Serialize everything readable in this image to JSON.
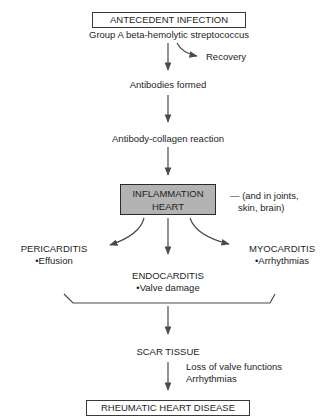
{
  "diagram": {
    "type": "flowchart",
    "nodes": {
      "antecedent": {
        "label": "ANTECEDENT INFECTION",
        "sub": "Group A beta-hemolytic streptococcus"
      },
      "recovery": {
        "label": "Recovery"
      },
      "antibodies": {
        "label": "Antibodies formed"
      },
      "reaction": {
        "label": "Antibody-collagen reaction"
      },
      "inflammation": {
        "line1": "INFLAMMATION",
        "line2": "HEART"
      },
      "inflammation_note": {
        "line1": "— (and in joints,",
        "line2": "skin, brain)"
      },
      "pericarditis": {
        "label": "PERICARDITIS",
        "bullet": "•Effusion"
      },
      "endocarditis": {
        "label": "ENDOCARDITIS",
        "bullet": "•Valve damage"
      },
      "myocarditis": {
        "label": "MYOCARDITIS",
        "bullet": "•Arrhythmias"
      },
      "scar": {
        "label": "SCAR TISSUE"
      },
      "scar_note": {
        "line1": "Loss of valve functions",
        "line2": "Arrhythmias"
      },
      "rhd": {
        "label": "RHEUMATIC HEART DISEASE"
      }
    },
    "edges": [
      [
        "antecedent",
        "recovery"
      ],
      [
        "antecedent",
        "antibodies"
      ],
      [
        "antibodies",
        "reaction"
      ],
      [
        "reaction",
        "inflammation"
      ],
      [
        "inflammation",
        "pericarditis"
      ],
      [
        "inflammation",
        "endocarditis"
      ],
      [
        "inflammation",
        "myocarditis"
      ],
      [
        "pericarditis+endocarditis+myocarditis",
        "scar"
      ],
      [
        "scar",
        "rhd"
      ]
    ],
    "colors": {
      "line": "#4a4a4a",
      "box_fill_highlight": "#b3b3b3",
      "text": "#1e1e1e"
    }
  }
}
